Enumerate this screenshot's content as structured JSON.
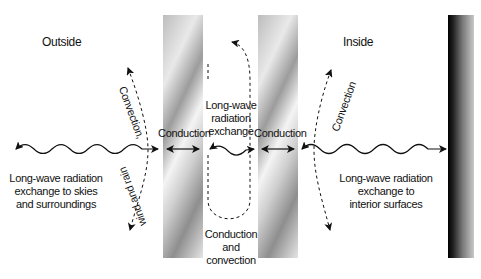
{
  "diagram": {
    "regions": {
      "outside": "Outside",
      "inside": "Inside"
    },
    "labels": {
      "outer_radiation": [
        "Long-wave radiation",
        "exchange to skies",
        "and surroundings"
      ],
      "outer_convection_top": "Convection,",
      "outer_convection_bottom": "wind and rain",
      "conduction_left": "Conduction",
      "cavity_radiation": [
        "Long-wave",
        "radiation",
        "exchange"
      ],
      "conduction_right": "Conduction",
      "cavity_convection": [
        "Conduction",
        "and",
        "convection"
      ],
      "inner_convection": "Convection",
      "inner_radiation": [
        "Long-wave radiation",
        "exchange to",
        "interior surfaces"
      ]
    },
    "elements": {
      "outer_pane": "glass-pane",
      "inner_pane": "glass-pane",
      "interior_wall": "interior-surface"
    },
    "colors": {
      "line": "#111111",
      "pane_light": "#f2f2f2",
      "pane_dark": "#9a9a9a",
      "wall_dark": "#000000",
      "wall_light": "#bdbdbd",
      "background": "#ffffff"
    }
  }
}
